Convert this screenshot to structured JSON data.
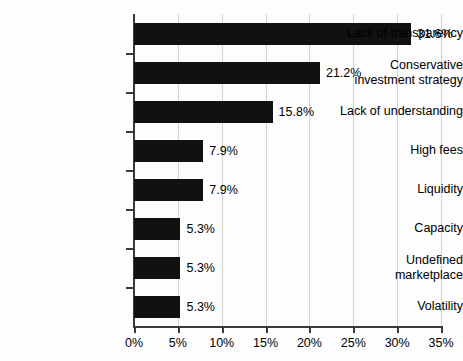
{
  "chart_data": {
    "type": "bar",
    "orientation": "horizontal",
    "title": "",
    "subtitle": "",
    "xlabel": "",
    "ylabel": "",
    "xlim": [
      0,
      35
    ],
    "xtick_step": 5,
    "grid": true,
    "legend": false,
    "bar_color": "#111111",
    "gridline_color": "#d2d2d2",
    "axis_color": "#3a3a3a",
    "background_color": "#fdfdfd",
    "categories": [
      "Lack of transparency",
      "Conservative\ninvestment strategy",
      "Lack of understanding",
      "High fees",
      "Liquidity",
      "Capacity",
      "Undefined\nmarketplace",
      "Volatility"
    ],
    "values": [
      31.6,
      21.2,
      15.8,
      7.9,
      7.9,
      5.3,
      5.3,
      5.3
    ],
    "value_labels": [
      "31.6%",
      "21.2%",
      "15.8%",
      "7.9%",
      "7.9%",
      "5.3%",
      "5.3%",
      "5.3%"
    ],
    "xticks": [
      0,
      5,
      10,
      15,
      20,
      25,
      30,
      35
    ],
    "xtick_labels": [
      "0%",
      "5%",
      "10%",
      "15%",
      "20%",
      "25%",
      "30%",
      "35%"
    ]
  }
}
